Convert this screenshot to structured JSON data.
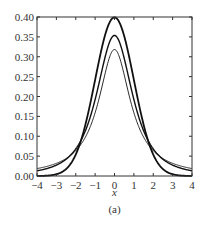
{
  "chart_data": {
    "type": "line",
    "title": "",
    "caption": "(a)",
    "xlabel": "x",
    "ylabel": "",
    "xlim": [
      -4,
      4
    ],
    "ylim": [
      0,
      0.4
    ],
    "xticks": [
      -4,
      -3,
      -2,
      -1,
      0,
      1,
      2,
      3,
      4
    ],
    "yticks": [
      "0.00",
      "0.05",
      "0.10",
      "0.15",
      "0.20",
      "0.25",
      "0.30",
      "0.35",
      "0.40"
    ],
    "grid": false,
    "legend": null,
    "series": [
      {
        "name": "normal (peak 0.40)",
        "width": 1.8,
        "x": [
          -4,
          -3,
          -2,
          -1,
          0,
          1,
          2,
          3,
          4
        ],
        "y": [
          0.0001,
          0.0044,
          0.054,
          0.242,
          0.399,
          0.242,
          0.054,
          0.0044,
          0.0001
        ]
      },
      {
        "name": "heavy-tailed, peak ~0.354",
        "width": 1.4,
        "x": [
          -4,
          -3,
          -2,
          -1,
          0,
          1,
          2,
          3,
          4
        ],
        "y": [
          0.013,
          0.027,
          0.068,
          0.192,
          0.354,
          0.192,
          0.068,
          0.027,
          0.013
        ]
      },
      {
        "name": "heavy-tailed, peak ~0.318",
        "width": 0.9,
        "x": [
          -4,
          -3,
          -2,
          -1,
          0,
          1,
          2,
          3,
          4
        ],
        "y": [
          0.019,
          0.032,
          0.064,
          0.159,
          0.318,
          0.159,
          0.064,
          0.032,
          0.019
        ]
      }
    ]
  }
}
